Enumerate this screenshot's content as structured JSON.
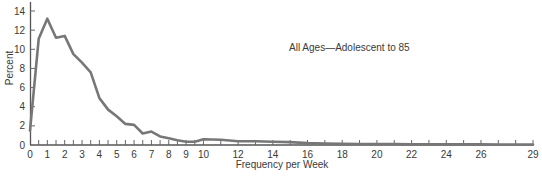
{
  "chart_data": {
    "type": "line",
    "title": "",
    "annotation": "All Ages—Adolescent to 85",
    "xlabel": "Frequency per Week",
    "ylabel": "Percent",
    "xlim": [
      0,
      29
    ],
    "ylim": [
      0,
      14
    ],
    "grid": false,
    "legend": "none",
    "x_tick_labels": [
      "0",
      "1",
      "2",
      "3",
      "4",
      "5",
      "6",
      "7",
      "8",
      "9",
      "10",
      "12",
      "14",
      "16",
      "18",
      "20",
      "22",
      "24",
      "26",
      "29"
    ],
    "y_tick_labels": [
      "0",
      "2",
      "4",
      "6",
      "8",
      "10",
      "12",
      "14"
    ],
    "series": [
      {
        "name": "All Ages—Adolescent to 85",
        "color": "#777777",
        "x": [
          0,
          0.5,
          1,
          1.5,
          2,
          2.5,
          3,
          3.5,
          4,
          4.5,
          5,
          5.5,
          6,
          6.5,
          7,
          7.5,
          8,
          8.5,
          9,
          9.5,
          10,
          11,
          12,
          13,
          14,
          15,
          16,
          17,
          18,
          19,
          20,
          21,
          22,
          23,
          24,
          25,
          26,
          27,
          28,
          29
        ],
        "values": [
          1.5,
          11.1,
          13.2,
          11.2,
          11.4,
          9.5,
          8.6,
          7.6,
          4.9,
          3.7,
          3.0,
          2.2,
          2.1,
          1.2,
          1.4,
          0.9,
          0.7,
          0.5,
          0.35,
          0.35,
          0.6,
          0.55,
          0.4,
          0.4,
          0.35,
          0.3,
          0.2,
          0.15,
          0.12,
          0.1,
          0.1,
          0.1,
          0.08,
          0.08,
          0.07,
          0.06,
          0.06,
          0.05,
          0.05,
          0.05
        ]
      }
    ]
  }
}
